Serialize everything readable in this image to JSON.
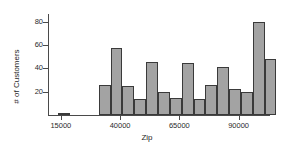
{
  "chart_data": {
    "type": "bar",
    "title": "",
    "xlabel": "Zip",
    "ylabel": "# of Customers",
    "xlim": [
      10000,
      102000
    ],
    "ylim": [
      0,
      86
    ],
    "grid": false,
    "legend": null,
    "bin_width": 5000,
    "x_ticks": [
      15000,
      40000,
      65000,
      90000
    ],
    "x_tick_labels": [
      "15000",
      "40000",
      "65000",
      "90000"
    ],
    "y_ticks": [
      20,
      40,
      60,
      80
    ],
    "y_tick_labels": [
      "20",
      "40",
      "60",
      "80"
    ],
    "bar_fill_color": "#a3a3a3",
    "bar_edge_color": "#3a3a3a",
    "axis_color": "#4a4a4a",
    "background_color": "#ffffff",
    "bins": [
      {
        "x_start": 14000,
        "x_end": 19000,
        "value": 2
      },
      {
        "x_start": 31000,
        "x_end": 36000,
        "value": 26
      },
      {
        "x_start": 36000,
        "x_end": 41000,
        "value": 58
      },
      {
        "x_start": 41000,
        "x_end": 46000,
        "value": 25
      },
      {
        "x_start": 46000,
        "x_end": 51000,
        "value": 14
      },
      {
        "x_start": 51000,
        "x_end": 56000,
        "value": 46
      },
      {
        "x_start": 56000,
        "x_end": 61000,
        "value": 20
      },
      {
        "x_start": 61000,
        "x_end": 66000,
        "value": 15
      },
      {
        "x_start": 66000,
        "x_end": 71000,
        "value": 45
      },
      {
        "x_start": 71000,
        "x_end": 76000,
        "value": 14
      },
      {
        "x_start": 76000,
        "x_end": 81000,
        "value": 26
      },
      {
        "x_start": 81000,
        "x_end": 86000,
        "value": 41
      },
      {
        "x_start": 86000,
        "x_end": 91000,
        "value": 22
      },
      {
        "x_start": 91000,
        "x_end": 96000,
        "value": 20
      },
      {
        "x_start": 96000,
        "x_end": 101000,
        "value": 80
      },
      {
        "x_start": 101000,
        "x_end": 106000,
        "value": 48
      }
    ],
    "categories": [
      "14000",
      "31000",
      "36000",
      "41000",
      "46000",
      "51000",
      "56000",
      "61000",
      "66000",
      "71000",
      "76000",
      "81000",
      "86000",
      "91000",
      "96000",
      "101000"
    ],
    "values": [
      2,
      26,
      58,
      25,
      14,
      46,
      20,
      15,
      45,
      14,
      26,
      41,
      22,
      20,
      80,
      48
    ]
  }
}
